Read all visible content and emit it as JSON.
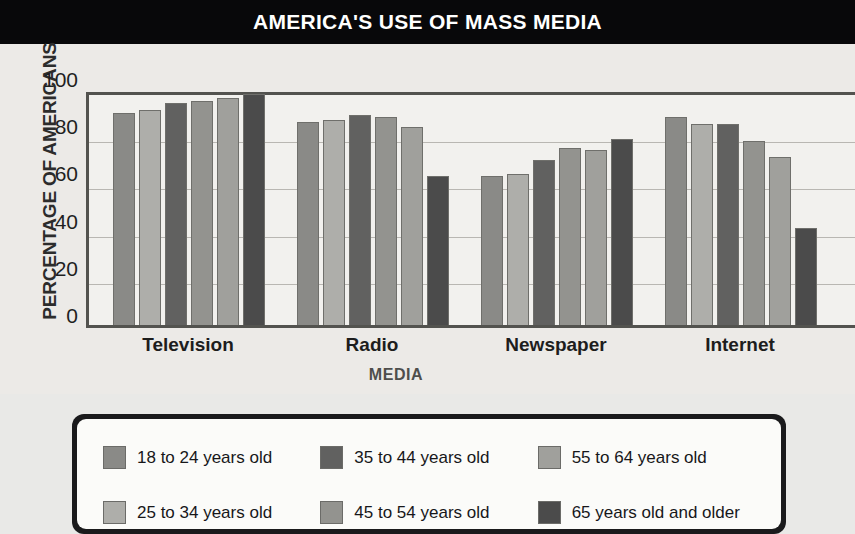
{
  "title": "AMERICA'S USE OF MASS MEDIA",
  "axes": {
    "y_title": "PERCENTAGE OF AMERICANS",
    "x_title": "MEDIA",
    "y_ticks": [
      "0",
      "20",
      "40",
      "60",
      "80",
      "100"
    ]
  },
  "legend": {
    "items": [
      {
        "label": "18 to 24 years old",
        "color": "#8a8a87"
      },
      {
        "label": "25 to 34 years old",
        "color": "#aeaeaa"
      },
      {
        "label": "35 to 44 years old",
        "color": "#616160"
      },
      {
        "label": "45 to 54 years old",
        "color": "#93938f"
      },
      {
        "label": "55 to 64 years old",
        "color": "#a0a09c"
      },
      {
        "label": "65 years old and older",
        "color": "#4b4b4b"
      }
    ]
  },
  "chart_data": {
    "type": "bar",
    "title": "AMERICA'S USE OF MASS MEDIA",
    "xlabel": "MEDIA",
    "ylabel": "PERCENTAGE OF AMERICANS",
    "ylim": [
      0,
      100
    ],
    "yticks": [
      0,
      20,
      40,
      60,
      80,
      100
    ],
    "grid": true,
    "legend_position": "bottom",
    "categories": [
      "Television",
      "Radio",
      "Newspaper",
      "Internet"
    ],
    "series": [
      {
        "name": "18 to 24 years old",
        "color": "#8a8a87",
        "values": [
          90,
          86,
          63,
          88
        ]
      },
      {
        "name": "25 to 34 years old",
        "color": "#aeaeaa",
        "values": [
          91,
          87,
          64,
          85
        ]
      },
      {
        "name": "35 to 44 years old",
        "color": "#616160",
        "values": [
          94,
          89,
          70,
          85
        ]
      },
      {
        "name": "45 to 54 years old",
        "color": "#93938f",
        "values": [
          95,
          88,
          75,
          78
        ]
      },
      {
        "name": "55 to 64 years old",
        "color": "#a0a09c",
        "values": [
          96,
          84,
          74,
          71
        ]
      },
      {
        "name": "65 years old and older",
        "color": "#4b4b4b",
        "values": [
          98,
          63,
          79,
          41
        ]
      }
    ]
  }
}
